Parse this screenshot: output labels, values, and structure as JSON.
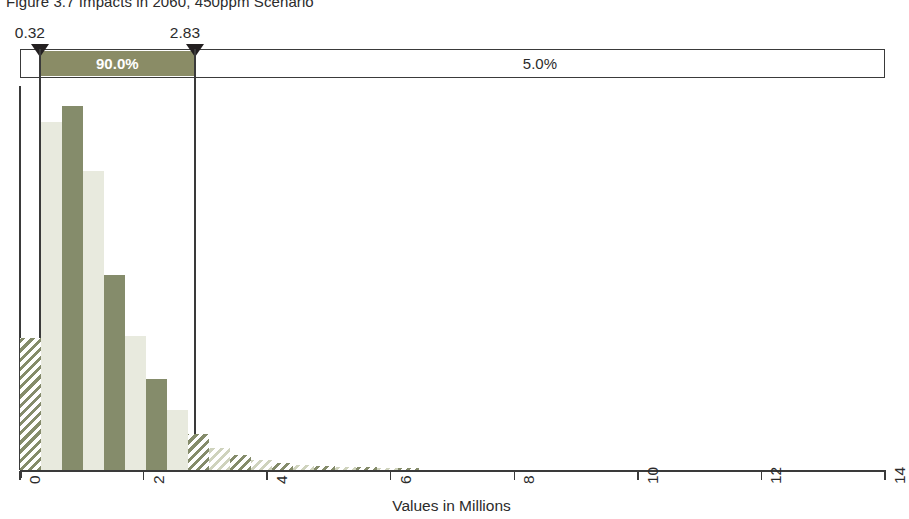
{
  "figure": {
    "title": "Figure 3.7 Impacts in 2060, 450ppm Scenario"
  },
  "percentile_bar": {
    "lower_bound_label": "0.32",
    "upper_bound_label": "2.83",
    "middle_segment_label": "90.0%",
    "right_segment_label": "5.0%",
    "lower_bound_value": 0.32,
    "upper_bound_value": 2.83,
    "band_color": "#8a8c66",
    "marker_color": "#231f20"
  },
  "axis": {
    "title": "Values in Millions",
    "tick_labels": [
      "0",
      "2",
      "4",
      "6",
      "8",
      "10",
      "12",
      "14"
    ],
    "tick_values": [
      0,
      2,
      4,
      6,
      8,
      10,
      12,
      14
    ],
    "min": 0,
    "max": 14
  },
  "colors": {
    "bar_dark": "#858c6b",
    "bar_light": "#e8eade",
    "line": "#3a3a3a",
    "text": "#2b2b2b"
  },
  "chart_data": {
    "type": "bar",
    "title": "Figure 3.7 Impacts in 2060, 450ppm Scenario",
    "xlabel": "Values in Millions",
    "ylabel": "",
    "xlim": [
      0,
      14
    ],
    "ylim": [
      0,
      1.0
    ],
    "grid": false,
    "legend": null,
    "bin_width": 0.34,
    "note": "Histogram of simulated impact values; bars outside the 5th-95th percentile band (0.32 to 2.83) are drawn hatched, bars inside alternate light and dark fill.",
    "categories": [
      "0.00-0.34",
      "0.34-0.68",
      "0.68-1.02",
      "1.02-1.36",
      "1.36-1.70",
      "1.70-2.04",
      "2.04-2.38",
      "2.38-2.72",
      "2.72-3.06",
      "3.06-3.40",
      "3.40-3.74",
      "3.74-4.08",
      "4.08-4.42",
      "4.42-4.76",
      "4.76-5.10",
      "5.10-5.44",
      "5.44-5.78",
      "5.78-6.12",
      "6.12-6.46"
    ],
    "x": [
      0.17,
      0.51,
      0.85,
      1.19,
      1.53,
      1.87,
      2.21,
      2.55,
      2.89,
      3.23,
      3.57,
      3.91,
      4.25,
      4.59,
      4.93,
      5.27,
      5.61,
      5.95,
      6.29
    ],
    "values": [
      0.345,
      0.912,
      0.953,
      0.783,
      0.51,
      0.351,
      0.238,
      0.158,
      0.093,
      0.058,
      0.039,
      0.027,
      0.019,
      0.014,
      0.011,
      0.009,
      0.008,
      0.006,
      0.004
    ],
    "bar_styles": [
      "hatch-dark",
      "solid-light",
      "solid-dark",
      "solid-light",
      "solid-dark",
      "solid-light",
      "solid-dark",
      "solid-light",
      "hatch-dark",
      "hatch-light",
      "hatch-dark",
      "hatch-light",
      "hatch-dark",
      "hatch-light",
      "hatch-dark",
      "hatch-light",
      "hatch-dark",
      "hatch-light",
      "hatch-dark"
    ]
  }
}
